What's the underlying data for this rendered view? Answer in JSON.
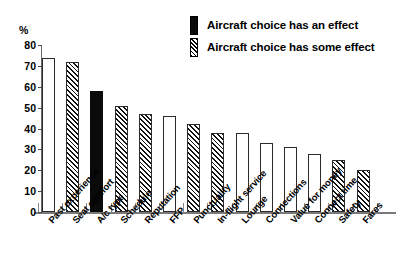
{
  "chart_data": {
    "type": "bar",
    "title": "",
    "subtitle": "",
    "xlabel": "",
    "ylabel": "%",
    "ylim": [
      0,
      80
    ],
    "yticks": [
      0,
      10,
      20,
      30,
      40,
      50,
      60,
      70,
      80
    ],
    "grid": false,
    "legend_position": "top-right",
    "categories": [
      "Past experience",
      "Seat comfort",
      "A/c type",
      "Schedule",
      "Reputation",
      "FFP",
      "Punctuality",
      "In-flight service",
      "Lounge",
      "Connections",
      "Value for money",
      "Connect time",
      "Safety",
      "Fares"
    ],
    "values": [
      74,
      72,
      58,
      51,
      47,
      46,
      42,
      38,
      38,
      33,
      31,
      28,
      25,
      20
    ],
    "fills": [
      "white",
      "hatch",
      "black",
      "hatch",
      "hatch",
      "white",
      "hatch",
      "hatch",
      "white",
      "white",
      "white",
      "white",
      "hatch",
      "hatch"
    ],
    "legend": [
      {
        "label": "Aircraft choice has an effect",
        "fill": "black"
      },
      {
        "label": "Aircraft choice has some effect",
        "fill": "hatch"
      }
    ],
    "colors": {
      "solid": "#0a0a0a",
      "hatch_line": "#111111",
      "bar_outline": "#2b2b2b",
      "axis": "#7a7a7a",
      "background": "#ffffff",
      "text": "#000000"
    }
  }
}
